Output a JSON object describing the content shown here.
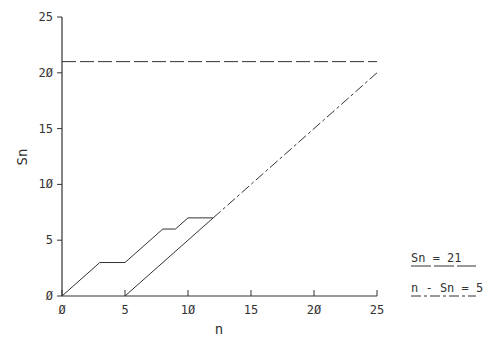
{
  "chart_data": {
    "type": "line",
    "title": "",
    "xlabel": "n",
    "ylabel": "Sn",
    "xlim": [
      0,
      25
    ],
    "ylim": [
      0,
      25
    ],
    "xticks": [
      0,
      5,
      10,
      15,
      20,
      25
    ],
    "yticks": [
      0,
      5,
      10,
      15,
      20,
      25
    ],
    "xtick_labels": [
      "Ø",
      "5",
      "1Ø",
      "15",
      "2Ø",
      "25"
    ],
    "ytick_labels": [
      "Ø",
      "5",
      "1Ø",
      "15",
      "2Ø",
      "25"
    ],
    "grid": false,
    "legend_position": "right",
    "series": [
      {
        "name": "Sn path",
        "style": "solid",
        "x": [
          0,
          3,
          5,
          8,
          9,
          10,
          12
        ],
        "y": [
          0,
          3,
          3,
          6,
          6,
          7,
          7
        ]
      },
      {
        "name": "Sn = 21",
        "style": "dashed",
        "x": [
          0,
          25
        ],
        "y": [
          21,
          21
        ]
      },
      {
        "name": "n - Sn = 5",
        "style": "dash-dot",
        "x": [
          5,
          25
        ],
        "y": [
          0,
          20
        ]
      }
    ]
  },
  "legend": {
    "items": [
      {
        "label": "Sn = 21",
        "style": "dashed"
      },
      {
        "label": "n - Sn = 5",
        "style": "dash-dot"
      }
    ]
  },
  "colors": {
    "line": "#333333",
    "background": "#ffffff"
  }
}
